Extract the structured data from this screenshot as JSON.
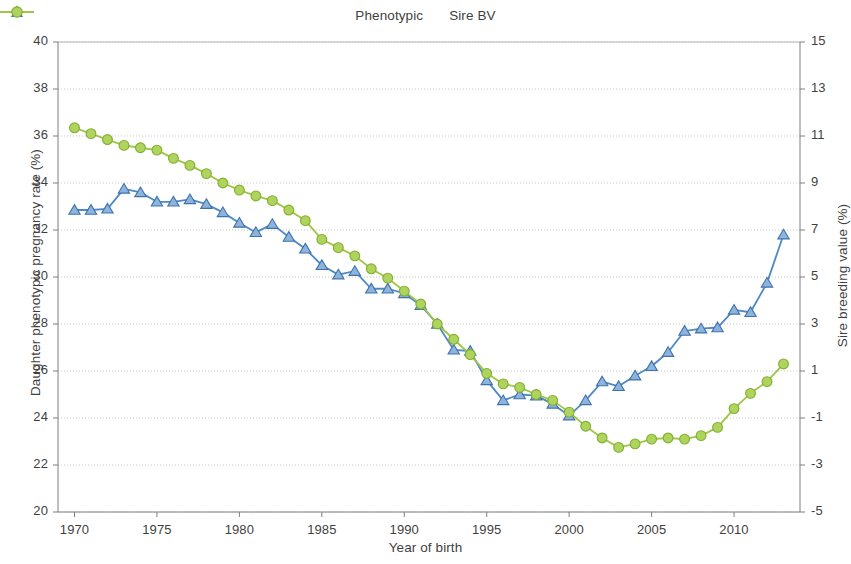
{
  "legend": {
    "items": [
      {
        "label": "Phenotypic",
        "marker": "triangle-marker-icon",
        "color": "#4E89C4"
      },
      {
        "label": "Sire BV",
        "marker": "circle-marker-icon",
        "color": "#9CC644"
      }
    ]
  },
  "axes": {
    "x_title": "Year of birth",
    "y_left_title": "Daughter phenotypic pregnancy rate (%)",
    "y_right_title": "Sire breeding value (%)"
  },
  "chart_data": {
    "type": "line",
    "title": "",
    "xlabel": "Year of birth",
    "ylabel": "Daughter phenotypic pregnancy rate (%)",
    "y2label": "Sire breeding value (%)",
    "xlim": [
      1969,
      2014
    ],
    "ylim": [
      20,
      40
    ],
    "y2lim": [
      -5,
      15
    ],
    "ytick_step": 2,
    "y2tick_step": 2,
    "grid": true,
    "legend_position": "top-center",
    "xticks": [
      1970,
      1975,
      1980,
      1985,
      1990,
      1995,
      2000,
      2005,
      2010
    ],
    "yticks": [
      20,
      22,
      24,
      26,
      28,
      30,
      32,
      34,
      36,
      38,
      40
    ],
    "y2ticks": [
      -5,
      -3,
      -1,
      1,
      3,
      5,
      7,
      9,
      11,
      13,
      15
    ],
    "x": [
      1970,
      1971,
      1972,
      1973,
      1974,
      1975,
      1976,
      1977,
      1978,
      1979,
      1980,
      1981,
      1982,
      1983,
      1984,
      1985,
      1986,
      1987,
      1988,
      1989,
      1990,
      1991,
      1992,
      1993,
      1994,
      1995,
      1996,
      1997,
      1998,
      1999,
      2000,
      2001,
      2002,
      2003,
      2004,
      2005,
      2006,
      2007,
      2008,
      2009,
      2010,
      2011,
      2012,
      2013
    ],
    "series": [
      {
        "name": "Phenotypic",
        "axis": "left",
        "color": "#4E89C4",
        "marker": "triangle",
        "values": [
          32.85,
          32.85,
          32.9,
          33.75,
          33.6,
          33.2,
          33.2,
          33.3,
          33.1,
          32.75,
          32.3,
          31.9,
          32.25,
          31.7,
          31.2,
          30.5,
          30.1,
          30.25,
          29.5,
          29.5,
          29.3,
          28.8,
          28.0,
          26.9,
          26.85,
          25.6,
          24.75,
          25.0,
          24.95,
          24.6,
          24.1,
          24.75,
          25.55,
          25.35,
          25.8,
          26.2,
          26.8,
          27.7,
          27.8,
          27.85,
          28.6,
          28.5,
          29.75,
          31.8
        ]
      },
      {
        "name": "Sire BV",
        "axis": "right",
        "color": "#9CC644",
        "values": [
          11.35,
          11.1,
          10.85,
          10.6,
          10.5,
          10.4,
          10.05,
          9.75,
          9.4,
          9.0,
          8.7,
          8.45,
          8.25,
          7.85,
          7.4,
          6.6,
          6.25,
          5.9,
          5.35,
          4.95,
          4.4,
          3.85,
          3.0,
          2.35,
          1.7,
          0.9,
          0.45,
          0.3,
          0.0,
          -0.25,
          -0.75,
          -1.35,
          -1.85,
          -2.25,
          -2.1,
          -1.9,
          -1.85,
          -1.9,
          -1.75,
          -1.4,
          -0.6,
          0.05,
          0.55,
          1.3
        ]
      }
    ]
  }
}
